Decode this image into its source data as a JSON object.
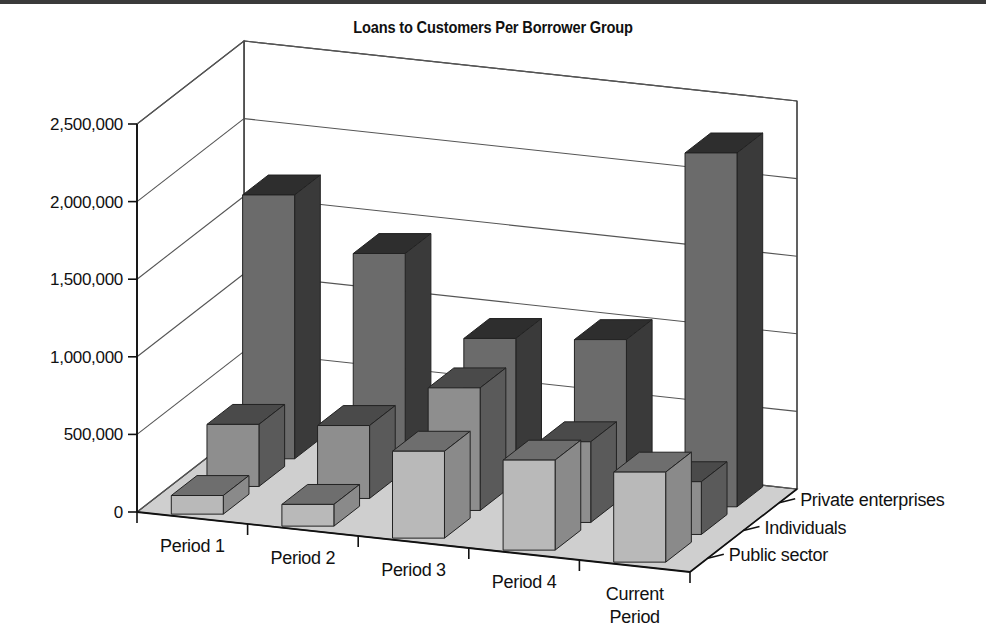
{
  "page": {
    "top_rule_color": "#3a3a3a",
    "background": "#ffffff"
  },
  "chart_data": {
    "type": "bar",
    "variant": "3d-grouped-bar",
    "title": "Loans to Customers Per Borrower Group",
    "xlabel": "",
    "ylabel": "",
    "categories": [
      "Period 1",
      "Period 2",
      "Period 3",
      "Period 4",
      "Current Period"
    ],
    "category_labels_multiline": [
      "Period 1",
      "Period 2",
      "Period 3",
      "Period 4",
      "Current\nPeriod"
    ],
    "series": [
      {
        "name": "Public sector",
        "depth_index": 0,
        "color": "#b9b9b9",
        "side_color": "#8a8a8a",
        "top_color": "#6e6e6e",
        "values": [
          120000,
          140000,
          560000,
          580000,
          580000
        ]
      },
      {
        "name": "Individuals",
        "depth_index": 1,
        "color": "#8e8e8e",
        "side_color": "#5a5a5a",
        "top_color": "#4a4a4a",
        "values": [
          400000,
          470000,
          790000,
          520000,
          340000
        ]
      },
      {
        "name": "Private enterprises",
        "depth_index": 2,
        "color": "#6b6b6b",
        "side_color": "#3a3a3a",
        "top_color": "#2e2e2e",
        "values": [
          1700000,
          1400000,
          930000,
          1000000,
          2280000
        ]
      }
    ],
    "ytick_labels": [
      "0",
      "500,000",
      "1,000,000",
      "1,500,000",
      "2,000,000",
      "2,500,000"
    ],
    "ytick_values": [
      0,
      500000,
      1000000,
      1500000,
      2000000,
      2500000
    ],
    "ylim": [
      0,
      2500000
    ],
    "grid": true,
    "grid_color": "#555555",
    "legend": "depth-axis-labels",
    "floor_color": "#cfcfcf",
    "wall_color": "#ffffff"
  },
  "geometry": {
    "origin_x": 137,
    "origin_y": 512,
    "axis_top_y": 124,
    "plot_right_x": 690,
    "depth_dx": 107,
    "depth_dy": -83,
    "unit_px_per_500k": 77.6
  }
}
